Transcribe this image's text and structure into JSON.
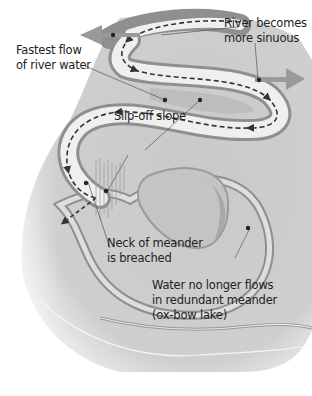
{
  "diagram": {
    "labels": {
      "fastest_flow": [
        "Fastest flow",
        "of river water"
      ],
      "sinuous": [
        "River becomes",
        "more sinuous"
      ],
      "slip_off": "Slip-off slope",
      "neck": [
        "Neck of meander",
        "is breached"
      ],
      "oxbow": [
        "Water no longer flows",
        "in redundant meander",
        "(ox-bow lake)"
      ]
    },
    "colors": {
      "land": "#c8c8c8",
      "land_light": "#dcdcdc",
      "river": "#eeeeee",
      "bank": "#8f8f8f",
      "arrow": "#9a9a9a",
      "flow": "#333333",
      "text": "#222222"
    }
  }
}
